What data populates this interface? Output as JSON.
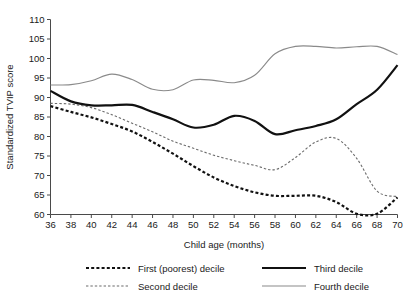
{
  "chart_data": {
    "type": "line",
    "title": "",
    "xlabel": "Child age (months)",
    "ylabel": "Standardized TVIP score",
    "xlim": [
      36,
      70
    ],
    "ylim": [
      60,
      110
    ],
    "xticks": [
      36,
      38,
      40,
      42,
      44,
      46,
      48,
      50,
      52,
      54,
      56,
      58,
      60,
      62,
      64,
      66,
      68,
      70
    ],
    "yticks": [
      60,
      65,
      70,
      75,
      80,
      85,
      90,
      95,
      100,
      105,
      110
    ],
    "grid": false,
    "legend_position": "bottom",
    "x": [
      36,
      38,
      40,
      42,
      44,
      46,
      48,
      50,
      52,
      54,
      56,
      58,
      60,
      62,
      64,
      66,
      68,
      70
    ],
    "series": [
      {
        "name": "First (poorest) decile",
        "style": "bold-dashed",
        "color": "#111111",
        "values": [
          87.8,
          86.3,
          84.9,
          83.2,
          81.3,
          78.6,
          75.6,
          72.4,
          69.5,
          67.3,
          65.7,
          64.8,
          64.8,
          64.8,
          63.2,
          60.2,
          60.2,
          64.4
        ]
      },
      {
        "name": "Second decile",
        "style": "thin-dashed",
        "color": "#6b6b6b",
        "values": [
          88.5,
          88.3,
          87.4,
          85.6,
          83.4,
          81.2,
          78.8,
          77.0,
          75.2,
          73.8,
          72.6,
          71.5,
          74.6,
          78.6,
          79.5,
          74.4,
          66.0,
          64.6
        ]
      },
      {
        "name": "Third decile",
        "style": "bold-solid",
        "color": "#111111",
        "values": [
          91.7,
          89.0,
          88.0,
          88.0,
          88.1,
          86.3,
          84.4,
          82.3,
          83.0,
          85.3,
          84.0,
          80.6,
          81.6,
          82.7,
          84.4,
          88.3,
          92.0,
          98.3
        ]
      },
      {
        "name": "Fourth decile",
        "style": "thin-solid",
        "color": "#8a8a8a",
        "values": [
          93.2,
          93.3,
          94.3,
          96.0,
          94.6,
          92.1,
          92.0,
          94.5,
          94.4,
          93.8,
          95.7,
          101.2,
          103.1,
          103.1,
          102.7,
          103.0,
          103.1,
          101.0
        ]
      }
    ]
  },
  "legend": {
    "items": [
      {
        "label": "First (poorest) decile"
      },
      {
        "label": "Second decile"
      },
      {
        "label": "Third decile"
      },
      {
        "label": "Fourth decile"
      }
    ]
  }
}
